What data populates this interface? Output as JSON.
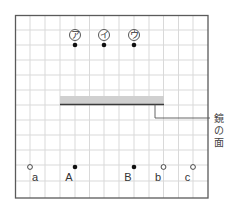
{
  "diagram": {
    "grid": {
      "x0": 15,
      "y0": 15,
      "cols": 13,
      "rows": 12,
      "cell": 14.85,
      "line_color": "#d8d8d8",
      "frame_color": "#555555"
    },
    "mirror": {
      "label": "鏡の面",
      "label_chars": [
        "鏡",
        "の",
        "面"
      ],
      "band_color": "#d2d2d2",
      "line_color": "#333333"
    },
    "top_points": [
      {
        "id": "a",
        "label": "ア",
        "type": "filled"
      },
      {
        "id": "i",
        "label": "イ",
        "type": "filled"
      },
      {
        "id": "u",
        "label": "ウ",
        "type": "filled"
      }
    ],
    "bottom_points": [
      {
        "label": "a",
        "type": "open"
      },
      {
        "label": "A",
        "type": "filled"
      },
      {
        "label": "B",
        "type": "filled"
      },
      {
        "label": "b",
        "type": "open"
      },
      {
        "label": "c",
        "type": "open"
      }
    ]
  }
}
